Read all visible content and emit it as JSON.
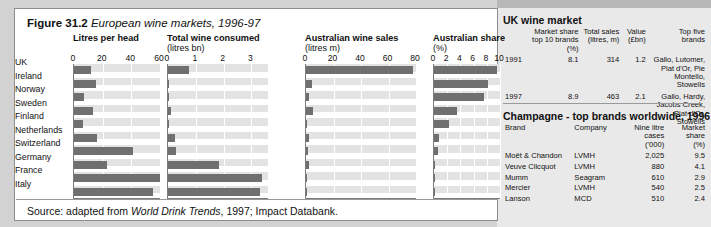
{
  "figure": {
    "number": "Figure 31.2",
    "title": "European wine markets, 1996-97",
    "source_prefix": "Source: adapted from ",
    "source_italic": "World Drink Trends",
    "source_suffix": ", 1997; Impact Databank."
  },
  "chart_data": [
    {
      "type": "bar",
      "orientation": "horizontal",
      "title": "Litres per head",
      "subtitle": "",
      "categories": [
        "UK",
        "Ireland",
        "Norway",
        "Sweden",
        "Finland",
        "Netherlands",
        "Switzerland",
        "Germany",
        "France",
        "Italy"
      ],
      "values": [
        12,
        15,
        7,
        13,
        6,
        16,
        41,
        23,
        60,
        55
      ],
      "xlabel": "",
      "ylabel": "",
      "xlim": [
        0,
        60
      ],
      "ticks": [
        0,
        20,
        40,
        60
      ],
      "grid": true
    },
    {
      "type": "bar",
      "orientation": "horizontal",
      "title": "Total wine consumed",
      "subtitle": "(litres bn)",
      "categories": [
        "UK",
        "Ireland",
        "Norway",
        "Sweden",
        "Finland",
        "Netherlands",
        "Switzerland",
        "Germany",
        "France",
        "Italy"
      ],
      "values": [
        0.75,
        0.05,
        0.03,
        0.11,
        0.03,
        0.24,
        0.29,
        1.85,
        3.4,
        3.3
      ],
      "xlabel": "",
      "ylabel": "",
      "xlim": [
        0,
        3.6
      ],
      "ticks": [
        0,
        1,
        2,
        3
      ],
      "grid": true
    },
    {
      "type": "bar",
      "orientation": "horizontal",
      "title": "Australian wine sales",
      "subtitle": "(litres m)",
      "categories": [
        "UK",
        "Ireland",
        "Norway",
        "Sweden",
        "Finland",
        "Netherlands",
        "Switzerland",
        "Germany",
        "France",
        "Italy"
      ],
      "values": [
        78,
        4,
        2.5,
        5,
        0.3,
        2.5,
        1.5,
        2.5,
        1,
        0.5
      ],
      "xlabel": "",
      "ylabel": "",
      "xlim": [
        0,
        80
      ],
      "ticks": [
        0,
        20,
        40,
        60,
        80
      ],
      "grid": true
    },
    {
      "type": "bar",
      "orientation": "horizontal",
      "title": "Australian share",
      "subtitle": "(%)",
      "categories": [
        "UK",
        "Ireland",
        "Norway",
        "Sweden",
        "Finland",
        "Netherlands",
        "Switzerland",
        "Germany",
        "France",
        "Italy"
      ],
      "values": [
        9.5,
        8.2,
        7.5,
        3.5,
        2.3,
        0.7,
        0.6,
        0.2,
        0.1,
        0.05
      ],
      "xlabel": "",
      "ylabel": "",
      "xlim": [
        0,
        10
      ],
      "ticks": [
        0,
        2,
        4,
        6,
        8,
        10
      ],
      "grid": true
    }
  ],
  "uk_table": {
    "title": "UK wine market",
    "headers": [
      "",
      "Market share\ntop 10 brands (%)",
      "Total sales\n(litres, m)",
      "Value\n(£bn)",
      "Top five\nbrands"
    ],
    "header_lines": [
      [
        "",
        "Market share",
        "Total sales",
        "Value",
        "Top five"
      ],
      [
        "",
        "top 10 brands (%)",
        "(litres, m)",
        "(£bn)",
        "brands"
      ]
    ],
    "rows": [
      {
        "year": "1991",
        "market_share": "8.1",
        "total_sales": "314",
        "value": "1.2",
        "top_brands": "Gallo, Lutomer, Piat d'Or, Pie Montello, Stowells"
      },
      {
        "year": "1997",
        "market_share": "8.9",
        "total_sales": "463",
        "value": "2.1",
        "top_brands": "Gallo, Hardy, Jacobs Creek, Piat d'Or, Stowells"
      }
    ]
  },
  "champagne_table": {
    "title": "Champagne - top brands worldwide, 1996",
    "header_lines": [
      [
        "Brand",
        "Company",
        "Nine litre cases",
        "Market share"
      ],
      [
        "",
        "",
        "('000)",
        "(%)"
      ]
    ],
    "rows": [
      {
        "brand": "Moët & Chandon",
        "company": "LVMH",
        "cases": "2,025",
        "share": "9.5"
      },
      {
        "brand": "Veuve Clicquot",
        "company": "LVMH",
        "cases": "880",
        "share": "4.1"
      },
      {
        "brand": "Mumm",
        "company": "Seagram",
        "cases": "610",
        "share": "2.9"
      },
      {
        "brand": "Mercier",
        "company": "LVMH",
        "cases": "540",
        "share": "2.5"
      },
      {
        "brand": "Lanson",
        "company": "MCD",
        "cases": "510",
        "share": "2.4"
      }
    ]
  },
  "colors": {
    "bar": "#6f6f6f",
    "plot_bg": "#e3e3e3",
    "panel_bg": "#e9e9e9",
    "page_bg": "#d2d2d2"
  }
}
